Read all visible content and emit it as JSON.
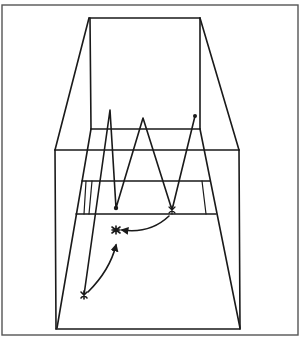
{
  "diagram": {
    "title": "",
    "description": "Perspective line drawing of a court/box with zig-zag path and movement arrows",
    "colors": {
      "line": "#1a1a1a",
      "frame": "#555555",
      "background": "#ffffff"
    },
    "markers": [
      {
        "type": "dot",
        "label": "",
        "x": 116,
        "y": 208
      },
      {
        "type": "star",
        "label": "",
        "x": 172,
        "y": 210
      },
      {
        "type": "star",
        "label": "",
        "x": 115,
        "y": 230
      },
      {
        "type": "star",
        "label": "",
        "x": 84,
        "y": 295
      },
      {
        "type": "dot",
        "label": "",
        "x": 195,
        "y": 116
      }
    ],
    "zigzag_path": [
      [
        84,
        295
      ],
      [
        110,
        110
      ],
      [
        116,
        208
      ],
      [
        143,
        118
      ],
      [
        172,
        210
      ],
      [
        195,
        116
      ]
    ],
    "arrows": [
      {
        "from": [
          170,
          216
        ],
        "to": [
          118,
          230
        ]
      },
      {
        "from": [
          88,
          292
        ],
        "to": [
          116,
          245
        ]
      }
    ]
  }
}
